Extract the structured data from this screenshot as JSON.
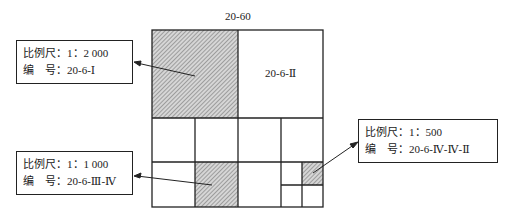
{
  "diagram": {
    "top_label": "20-60",
    "cell_label_ii": "20-6-Ⅱ",
    "callouts": [
      {
        "scale": "比例尺：1：2 000",
        "code": "编　号：20-6-Ⅰ"
      },
      {
        "scale": "比例尺：1：1 000",
        "code": "编　号：20-6-Ⅲ-Ⅳ"
      },
      {
        "scale": "比例尺：1：500",
        "code": "编　号：20-6-Ⅳ-Ⅳ-Ⅱ"
      }
    ],
    "colors": {
      "line": "#222222",
      "hatch": "#9a9a9a",
      "background": "#ffffff"
    }
  }
}
